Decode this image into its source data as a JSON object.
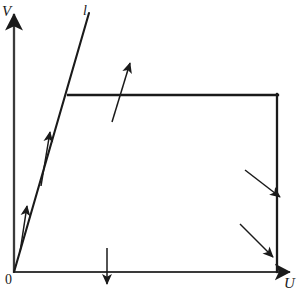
{
  "figure": {
    "kind": "line-diagram",
    "background_color": "#ffffff",
    "stroke_color": "#1a1a1a",
    "axes": {
      "vertical": {
        "label": "V",
        "name": "v-axis",
        "x": 14,
        "y_top": 12,
        "y_bottom": 273,
        "arrow": "up"
      },
      "horizontal": {
        "label": "U",
        "name": "u-axis",
        "y": 272,
        "x_left": 14,
        "x_right": 292,
        "arrow": "right"
      },
      "origin_label": "0"
    },
    "curves": [
      {
        "name": "diagonal-line",
        "label": "l",
        "from": [
          14,
          272
        ],
        "to": [
          89,
          13
        ],
        "stroke_width": 2.1
      },
      {
        "name": "top-horizontal-line",
        "label": "",
        "from": [
          68,
          95
        ],
        "to": [
          277,
          95
        ],
        "stroke_width": 2.2
      },
      {
        "name": "right-vertical-line",
        "label": "",
        "from": [
          277,
          95
        ],
        "to": [
          277,
          272
        ],
        "stroke_width": 2.2
      }
    ],
    "arrows": [
      {
        "name": "arrow-diagonal-lower",
        "from": [
          20,
          252
        ],
        "to": [
          27,
          205
        ],
        "direction": "up",
        "stroke_width": 1.5
      },
      {
        "name": "arrow-diagonal-upper",
        "from": [
          41,
          186
        ],
        "to": [
          50,
          131
        ],
        "direction": "up",
        "stroke_width": 1.5
      },
      {
        "name": "arrow-top-line-crossing",
        "from": [
          112,
          122
        ],
        "to": [
          131,
          62
        ],
        "direction": "up-right",
        "stroke_width": 1.5
      },
      {
        "name": "arrow-x-axis-crossing",
        "from": [
          107,
          248
        ],
        "to": [
          107,
          285
        ],
        "direction": "down",
        "stroke_width": 1.5
      },
      {
        "name": "arrow-right-line-upper",
        "from": [
          245,
          170
        ],
        "to": [
          281,
          198
        ],
        "direction": "down-right",
        "stroke_width": 1.5
      },
      {
        "name": "arrow-right-line-lower",
        "from": [
          240,
          224
        ],
        "to": [
          274,
          258
        ],
        "direction": "down-right",
        "stroke_width": 1.5
      }
    ]
  }
}
